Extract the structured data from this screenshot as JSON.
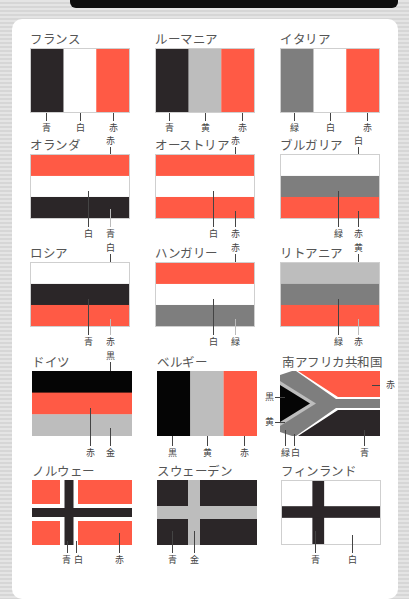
{
  "colors": {
    "black": "#2b2628",
    "white": "#ffffff",
    "red": "#ff5a45",
    "light_gray": "#bdbdbd",
    "dark_gray": "#7e7e7e",
    "pure_black": "#050505"
  },
  "flags": [
    {
      "name": "フランス",
      "labels": [
        "青",
        "白",
        "赤"
      ]
    },
    {
      "name": "ルーマニア",
      "labels": [
        "青",
        "黄",
        "赤"
      ]
    },
    {
      "name": "イタリア",
      "labels": [
        "緑",
        "白",
        "赤"
      ]
    },
    {
      "name": "オランダ",
      "labels": [
        "赤",
        "白",
        "青"
      ]
    },
    {
      "name": "オーストリア",
      "labels": [
        "赤",
        "白",
        "赤"
      ]
    },
    {
      "name": "ブルガリア",
      "labels": [
        "白",
        "緑",
        "赤"
      ]
    },
    {
      "name": "ロシア",
      "labels": [
        "白",
        "青",
        "赤"
      ]
    },
    {
      "name": "ハンガリー",
      "labels": [
        "赤",
        "白",
        "緑"
      ]
    },
    {
      "name": "リトアニア",
      "labels": [
        "黄",
        "緑",
        "赤"
      ]
    },
    {
      "name": "ドイツ",
      "labels": [
        "黒",
        "赤",
        "金"
      ]
    },
    {
      "name": "ベルギー",
      "labels": [
        "黒",
        "黄",
        "赤"
      ]
    },
    {
      "name": "南アフリカ共和国",
      "labels": [
        "赤",
        "黒",
        "黄",
        "緑",
        "白",
        "青"
      ]
    },
    {
      "name": "ノルウェー",
      "labels": [
        "青",
        "白",
        "赤"
      ]
    },
    {
      "name": "スウェーデン",
      "labels": [
        "青",
        "金"
      ]
    },
    {
      "name": "フィンランド",
      "labels": [
        "青",
        "白"
      ]
    }
  ]
}
